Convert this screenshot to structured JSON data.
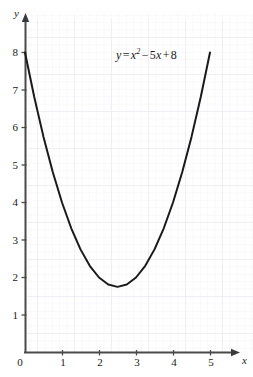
{
  "chart_data": {
    "type": "line",
    "title": "",
    "subtitle": "",
    "annotation": "y = x² − 5x + 8",
    "annotation_parts": {
      "lhs": "y",
      "equals": "=",
      "var": "x",
      "exponent": "2",
      "minus": "−",
      "coefficient": "5",
      "var2": "x",
      "plus": "+",
      "constant": "8"
    },
    "xlabel": "x",
    "ylabel": "y",
    "xlim": [
      0,
      5.55
    ],
    "ylim": [
      0,
      8.85
    ],
    "xticks": [
      0,
      1,
      2,
      3,
      4,
      5
    ],
    "yticks": [
      0,
      1,
      2,
      3,
      4,
      5,
      6,
      7,
      8
    ],
    "xtick_labels": [
      "0",
      "1",
      "2",
      "3",
      "4",
      "5"
    ],
    "ytick_labels": [
      "0",
      "1",
      "2",
      "3",
      "4",
      "5",
      "6",
      "7",
      "8"
    ],
    "grid": true,
    "grid_minor_per_major": 5,
    "legend": false,
    "vertex": [
      2.5,
      1.75
    ],
    "domain": [
      0,
      5
    ],
    "series": [
      {
        "name": "y = x^2 - 5x + 8",
        "x": [
          0,
          0.25,
          0.5,
          0.75,
          1,
          1.25,
          1.5,
          1.75,
          2,
          2.25,
          2.5,
          2.75,
          3,
          3.25,
          3.5,
          3.75,
          4,
          4.25,
          4.5,
          4.75,
          5
        ],
        "y": [
          8,
          6.8125,
          5.75,
          4.8125,
          4,
          3.3125,
          2.75,
          2.3125,
          2,
          1.8125,
          1.75,
          1.8125,
          2,
          2.3125,
          2.75,
          3.3125,
          4,
          4.8125,
          5.75,
          6.8125,
          8
        ]
      }
    ]
  },
  "style": {
    "curve_color": "#1a1a1a",
    "axis_color": "#4a4a4a",
    "grid_minor_color": "#f1f0f4",
    "grid_major_color": "#e6e4ec",
    "text_color": "#1a1a1a",
    "background": "#ffffff"
  }
}
